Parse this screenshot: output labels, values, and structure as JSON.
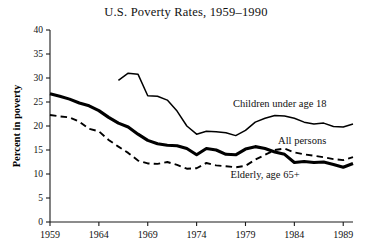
{
  "chart_data": {
    "type": "line",
    "title": "U.S. Poverty Rates, 1959–1990",
    "xlabel": "",
    "ylabel": "Percent in poverty",
    "xlim": [
      1959,
      1990
    ],
    "ylim": [
      0,
      40
    ],
    "ytick_labels": [
      "0",
      "5",
      "10",
      "15",
      "20",
      "25",
      "30",
      "35",
      "40"
    ],
    "yticks": [
      0,
      5,
      10,
      15,
      20,
      25,
      30,
      35,
      40
    ],
    "xtick_labels": [
      "1959",
      "1964",
      "1969",
      "1974",
      "1979",
      "1984",
      "1989"
    ],
    "xticks": [
      1959,
      1964,
      1969,
      1974,
      1979,
      1984,
      1989
    ],
    "grid": false,
    "legend_position": "inline-annotations",
    "series": [
      {
        "name": "Elderly, age 65+",
        "style": "thick-solid",
        "label": "Elderly, age 65+",
        "label_x": 1981.0,
        "label_y": 9.2,
        "x": [
          1959,
          1960,
          1961,
          1962,
          1963,
          1964,
          1965,
          1966,
          1967,
          1968,
          1969,
          1970,
          1971,
          1972,
          1973,
          1974,
          1975,
          1976,
          1977,
          1978,
          1979,
          1980,
          1981,
          1982,
          1983,
          1984,
          1985,
          1986,
          1987,
          1988,
          1989,
          1990
        ],
        "y": [
          26.7,
          26.2,
          25.6,
          24.8,
          24.2,
          23.2,
          21.8,
          20.6,
          19.8,
          18.3,
          17.0,
          16.3,
          16.0,
          15.9,
          15.3,
          14.0,
          15.3,
          15.0,
          14.1,
          14.0,
          15.2,
          15.7,
          15.3,
          14.6,
          14.1,
          12.4,
          12.6,
          12.4,
          12.5,
          12.0,
          11.4,
          12.2
        ]
      },
      {
        "name": "All persons",
        "style": "dashed",
        "label": "All persons",
        "label_x": 1984.8,
        "label_y": 16.3,
        "x": [
          1959,
          1960,
          1961,
          1962,
          1963,
          1964,
          1965,
          1966,
          1967,
          1968,
          1969,
          1970,
          1971,
          1972,
          1973,
          1974,
          1975,
          1976,
          1977,
          1978,
          1979,
          1980,
          1981,
          1982,
          1983,
          1984,
          1985,
          1986,
          1987,
          1988,
          1989,
          1990
        ],
        "y": [
          22.3,
          22.0,
          21.8,
          20.9,
          19.4,
          18.9,
          17.1,
          15.7,
          14.4,
          12.8,
          12.2,
          12.1,
          12.5,
          11.9,
          11.1,
          11.2,
          12.3,
          11.8,
          11.6,
          11.4,
          11.7,
          13.0,
          14.0,
          15.0,
          15.3,
          14.5,
          14.1,
          13.8,
          13.5,
          13.1,
          12.9,
          13.5
        ]
      },
      {
        "name": "Children under age 18",
        "style": "thin-solid",
        "label": "Children under age 18",
        "label_x": 1982.5,
        "label_y": 23.9,
        "x": [
          1966,
          1967,
          1968,
          1969,
          1970,
          1971,
          1972,
          1973,
          1974,
          1975,
          1976,
          1977,
          1978,
          1979,
          1980,
          1981,
          1982,
          1983,
          1984,
          1985,
          1986,
          1987,
          1988,
          1989,
          1990
        ],
        "y": [
          29.5,
          31.0,
          30.8,
          26.3,
          26.2,
          25.4,
          23.1,
          20.0,
          18.3,
          18.9,
          18.8,
          18.6,
          18.0,
          19.1,
          20.8,
          21.6,
          22.2,
          22.1,
          21.6,
          20.8,
          20.4,
          20.6,
          19.9,
          19.8,
          20.4
        ]
      }
    ]
  }
}
